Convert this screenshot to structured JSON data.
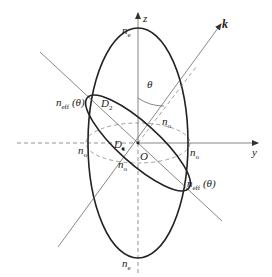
{
  "diagram": {
    "type": "index-ellipsoid",
    "axes": {
      "z_label": "z",
      "y_label": "y",
      "k_label": "k",
      "origin_label": "O",
      "theta_label": "θ"
    },
    "labels": {
      "ne_top": {
        "base": "n",
        "sub": "e"
      },
      "ne_bottom": {
        "base": "n",
        "sub": "e"
      },
      "no_left": {
        "base": "n",
        "sub": "o"
      },
      "no_right": {
        "base": "n",
        "sub": "o"
      },
      "no_upper_diag": {
        "base": "n",
        "sub": "o"
      },
      "no_lower_diag": {
        "base": "n",
        "sub": "o"
      },
      "neff_left": {
        "base": "n",
        "sub": "eff",
        "arg": "(θ)"
      },
      "neff_right": {
        "base": "n",
        "sub": "eff",
        "arg": "(θ)"
      },
      "d1": {
        "base": "D",
        "sub": "1"
      },
      "d2": {
        "base": "D",
        "sub": "2"
      }
    },
    "colors": {
      "stroke": "#222222",
      "thin": "#555555",
      "dashed": "#777777"
    }
  }
}
